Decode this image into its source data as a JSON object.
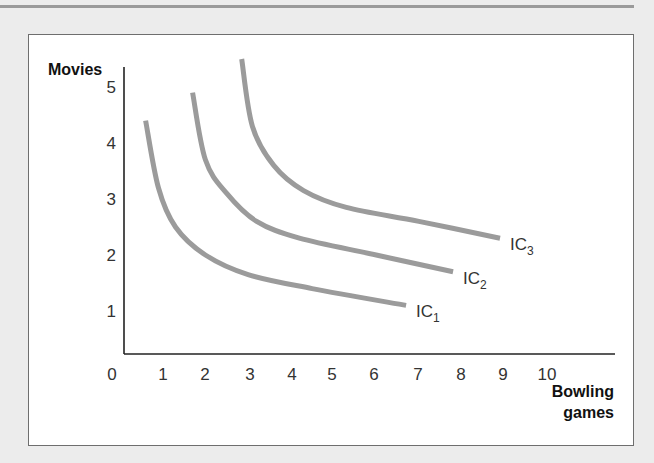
{
  "chart_data": {
    "type": "line",
    "title": "",
    "xlabel": "Bowling games",
    "ylabel": "Movies",
    "x_ticks": [
      "0",
      "1",
      "2",
      "3",
      "4",
      "5",
      "6",
      "7",
      "8",
      "9",
      "10"
    ],
    "y_ticks": [
      "1",
      "2",
      "3",
      "4",
      "5"
    ],
    "xlim": [
      0,
      10
    ],
    "ylim": [
      0,
      5.5
    ],
    "grid": false,
    "legend": "inline labels at curve ends",
    "series": [
      {
        "name": "IC1",
        "label_main": "IC",
        "label_sub": "1",
        "points": [
          [
            0.6,
            4.4
          ],
          [
            0.9,
            3.2
          ],
          [
            1.3,
            2.5
          ],
          [
            2.0,
            2.0
          ],
          [
            3.0,
            1.65
          ],
          [
            4.5,
            1.4
          ],
          [
            6.7,
            1.1
          ]
        ]
      },
      {
        "name": "IC2",
        "label_main": "IC",
        "label_sub": "2",
        "points": [
          [
            1.7,
            4.9
          ],
          [
            2.0,
            3.7
          ],
          [
            2.5,
            3.1
          ],
          [
            3.2,
            2.6
          ],
          [
            4.2,
            2.3
          ],
          [
            6.0,
            2.0
          ],
          [
            7.8,
            1.7
          ]
        ]
      },
      {
        "name": "IC3",
        "label_main": "IC",
        "label_sub": "3",
        "points": [
          [
            2.85,
            5.5
          ],
          [
            3.1,
            4.3
          ],
          [
            3.6,
            3.6
          ],
          [
            4.3,
            3.15
          ],
          [
            5.3,
            2.85
          ],
          [
            7.0,
            2.6
          ],
          [
            8.9,
            2.3
          ]
        ]
      }
    ],
    "line_color": "#9b9b9b"
  },
  "labels": {
    "y_axis_title": "Movies",
    "x_axis_title_line1": "Bowling",
    "x_axis_title_line2": "games"
  }
}
